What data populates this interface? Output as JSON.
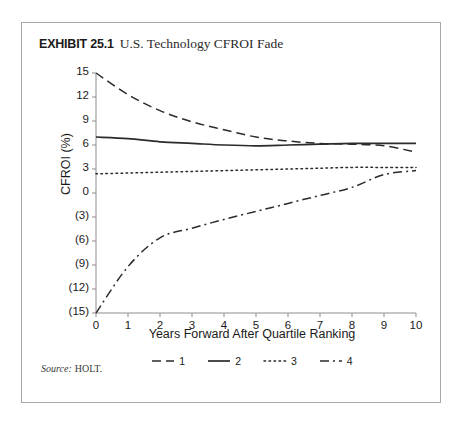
{
  "exhibit": {
    "number_label": "EXHIBIT 25.1",
    "title": "U.S. Technology CFROI Fade"
  },
  "source": {
    "label": "Source:",
    "value": "HOLT."
  },
  "chart_data": {
    "type": "line",
    "title": "U.S. Technology CFROI Fade",
    "xlabel": "Years Forward After Quartile Ranking",
    "ylabel": "CFROI (%)",
    "x": [
      0,
      1,
      2,
      3,
      4,
      5,
      6,
      7,
      8,
      9,
      10
    ],
    "xlim": [
      0,
      10
    ],
    "ylim": [
      -15,
      15
    ],
    "xticks": [
      "0",
      "1",
      "2",
      "3",
      "4",
      "5",
      "6",
      "7",
      "8",
      "9",
      "10"
    ],
    "yticks": [
      "15",
      "12",
      "9",
      "6",
      "3",
      "0",
      "(3)",
      "(6)",
      "(9)",
      "(12)",
      "(15)"
    ],
    "ytick_values": [
      15,
      12,
      9,
      6,
      3,
      0,
      -3,
      -6,
      -9,
      -12,
      -15
    ],
    "grid": false,
    "legend_position": "bottom",
    "series": [
      {
        "name": "1",
        "style": "dashed",
        "color": "#2b2b2b",
        "values": [
          15.0,
          12.3,
          10.3,
          8.9,
          7.9,
          7.0,
          6.5,
          6.2,
          6.1,
          5.9,
          5.1
        ]
      },
      {
        "name": "2",
        "style": "solid",
        "color": "#2b2b2b",
        "values": [
          7.0,
          6.8,
          6.4,
          6.2,
          6.0,
          5.9,
          6.0,
          6.1,
          6.2,
          6.2,
          6.2
        ]
      },
      {
        "name": "3",
        "style": "dotted",
        "color": "#2b2b2b",
        "values": [
          2.4,
          2.5,
          2.6,
          2.7,
          2.8,
          2.9,
          3.0,
          3.1,
          3.2,
          3.2,
          3.2
        ]
      },
      {
        "name": "4",
        "style": "dashdot",
        "color": "#2b2b2b",
        "values": [
          -15.0,
          -9.2,
          -5.6,
          -4.4,
          -3.3,
          -2.3,
          -1.3,
          -0.3,
          0.7,
          2.3,
          2.8
        ]
      }
    ]
  }
}
